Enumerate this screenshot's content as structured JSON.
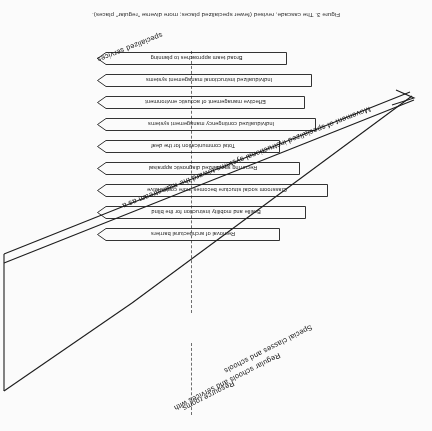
{
  "figure": {
    "caption": "Figure 3. The cascade, revised (fewer specialized places; more diverse \"regular\" places).",
    "orientation_note": "180-rotated scan",
    "ink_color": "#1a1a1a",
    "paper_color": "#ffffff"
  },
  "axes": {
    "top_label": "Movement of specialized instructional systems toward the mainstream as a",
    "top_label_tail": "specialized services",
    "arrow_label": "Mainstream",
    "lower_labels": [
      "Special classes and schools",
      "Regular schools and services with",
      "Resource rooms"
    ]
  },
  "levels": [
    {
      "id": "level-1",
      "label": "Broad team approaches to planning"
    },
    {
      "id": "level-2",
      "label": "Individualized instructional management systems"
    },
    {
      "id": "level-3",
      "label": "Effective management of acoustic environment"
    },
    {
      "id": "level-4",
      "label": "Individualized contingency management systems"
    },
    {
      "id": "level-5",
      "label": "Total communication for the deaf"
    },
    {
      "id": "level-6",
      "label": "Recurring specialized diagnostic appraisal"
    },
    {
      "id": "level-7",
      "label": "Classroom social structure becomes more cooperative"
    },
    {
      "id": "level-8",
      "label": "Braille and mobility instruction for the blind"
    },
    {
      "id": "level-9",
      "label": "Removal of architectural barriers"
    }
  ]
}
